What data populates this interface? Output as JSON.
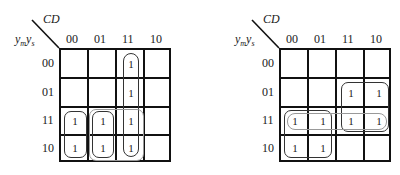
{
  "maps": [
    {
      "id": "left",
      "col_var": "CD",
      "row_var_main": "y",
      "row_var_sub1": "m",
      "row_var_sub2": "s",
      "col_headers": [
        "00",
        "01",
        "11",
        "10"
      ],
      "row_headers": [
        "00",
        "01",
        "11",
        "10"
      ],
      "cells": [
        [
          "",
          "",
          "1",
          ""
        ],
        [
          "",
          "",
          "1",
          ""
        ],
        [
          "1",
          "1",
          "1",
          ""
        ],
        [
          "1",
          "1",
          "1",
          ""
        ]
      ],
      "groups": [
        {
          "rows": [
            0,
            3
          ],
          "cols": [
            2,
            2
          ],
          "color": "#333333"
        },
        {
          "rows": [
            2,
            3
          ],
          "cols": [
            0,
            0
          ],
          "color": "#333333"
        },
        {
          "rows": [
            2,
            3
          ],
          "cols": [
            1,
            1
          ],
          "color": "#333333"
        },
        {
          "rows": [
            2,
            3
          ],
          "cols": [
            1,
            2
          ],
          "color": "#999999"
        }
      ]
    },
    {
      "id": "right",
      "col_var": "CD",
      "row_var_main": "y",
      "row_var_sub1": "m",
      "row_var_sub2": "s",
      "col_headers": [
        "00",
        "01",
        "11",
        "10"
      ],
      "row_headers": [
        "00",
        "01",
        "11",
        "10"
      ],
      "cells": [
        [
          "",
          "",
          "",
          ""
        ],
        [
          "",
          "",
          "1",
          "1"
        ],
        [
          "1",
          "1",
          "1",
          "1"
        ],
        [
          "1",
          "1",
          "",
          ""
        ]
      ],
      "groups": [
        {
          "rows": [
            1,
            2
          ],
          "cols": [
            2,
            3
          ],
          "color": "#333333"
        },
        {
          "rows": [
            2,
            3
          ],
          "cols": [
            0,
            1
          ],
          "color": "#333333"
        },
        {
          "rows": [
            2,
            2
          ],
          "cols": [
            0,
            3
          ],
          "color": "#999999"
        }
      ]
    }
  ]
}
